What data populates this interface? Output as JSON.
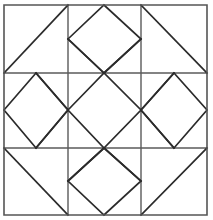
{
  "figure": {
    "kind": "geometric-line-drawing",
    "background_color": "#ffffff",
    "canvas": {
      "width": 213,
      "height": 220
    }
  },
  "colors": {
    "frame_stroke": "#555555",
    "grid_stroke": "#5a5a5a",
    "motif_stroke": "#2b2b2b",
    "fill": "none"
  },
  "geometry": {
    "frame": {
      "left": 4,
      "top": 5,
      "right": 207,
      "bottom": 215
    },
    "grid_x": [
      4,
      68,
      141,
      207
    ],
    "grid_y": [
      5,
      73,
      148,
      215
    ],
    "columns": 3,
    "rows": 3
  },
  "cells": [
    {
      "name": "top-left-corner",
      "row": 0,
      "col": 0,
      "motif": "diagonal-triangle",
      "diagonal": "bottom-left-to-top-right",
      "points": "4,73 68,5"
    },
    {
      "name": "top-middle-diamond",
      "row": 0,
      "col": 1,
      "motif": "inscribed-diamond",
      "points": "68,39 104,5 141,39 104,73 68,39"
    },
    {
      "name": "top-right-corner",
      "row": 0,
      "col": 2,
      "motif": "diagonal-triangle",
      "diagonal": "top-left-to-bottom-right",
      "points": "141,5 207,73"
    },
    {
      "name": "left-middle-diamond",
      "row": 1,
      "col": 0,
      "motif": "inscribed-diamond",
      "points": "4,110 36,73 68,110 36,148 4,110"
    },
    {
      "name": "center-diamond",
      "row": 1,
      "col": 1,
      "motif": "extended-diamond",
      "points": "68,110 104,73 141,110 104,148 68,110"
    },
    {
      "name": "right-middle-diamond",
      "row": 1,
      "col": 2,
      "motif": "inscribed-diamond",
      "points": "141,110 174,73 207,110 174,148 141,110"
    },
    {
      "name": "bottom-left-corner",
      "row": 2,
      "col": 0,
      "motif": "diagonal-triangle",
      "diagonal": "top-left-to-bottom-right",
      "points": "4,148 68,215"
    },
    {
      "name": "bottom-middle-diamond",
      "row": 2,
      "col": 1,
      "motif": "inscribed-diamond",
      "points": "68,181 104,148 141,181 104,215 68,181"
    },
    {
      "name": "bottom-right-corner",
      "row": 2,
      "col": 2,
      "motif": "diagonal-triangle",
      "diagonal": "bottom-left-to-top-right",
      "points": "141,215 207,148"
    }
  ],
  "crossings": [
    {
      "name": "crossing-top-left",
      "x": 68,
      "y": 73
    },
    {
      "name": "crossing-top-right",
      "x": 141,
      "y": 73
    },
    {
      "name": "crossing-bottom-left",
      "x": 68,
      "y": 148
    },
    {
      "name": "crossing-bottom-right",
      "x": 141,
      "y": 148
    }
  ],
  "paths": {
    "frame": "M4,5 L207,5 L207,215 L4,215 Z",
    "grid_vertical_1": "M68,5 L68,215",
    "grid_vertical_2": "M141,5 L141,215",
    "grid_horizontal_1": "M4,73 L207,73",
    "grid_horizontal_2": "M4,148 L207,148",
    "corner_tl_diagonal": "M4,73 L68,5",
    "corner_tr_diagonal": "M141,5 L207,73",
    "corner_bl_diagonal": "M4,148 L68,215",
    "corner_br_diagonal": "M141,215 L207,148",
    "diamond_top": "M68,39 L104,5 L141,39 L104,73 Z",
    "diamond_left": "M4,110 L36,73 L68,110 L36,148 Z",
    "diamond_right": "M141,110 L174,73 L207,110 L174,148 Z",
    "diamond_bottom": "M68,181 L104,148 L141,181 L104,215 Z",
    "diamond_center": "M68,110 L104,73 L141,110 L104,148 Z",
    "center_ray_nw": "M68,110 L36,148",
    "center_ray_ne": "M141,110 L174,148",
    "center_ray_sw": "M68,110 L36,73",
    "center_ray_se": "M141,110 L174,73",
    "center_ray_n_left": "M104,73 L68,39",
    "center_ray_n_right": "M104,73 L141,39",
    "center_ray_s_left": "M104,148 L68,181",
    "center_ray_s_right": "M104,148 L141,181"
  }
}
